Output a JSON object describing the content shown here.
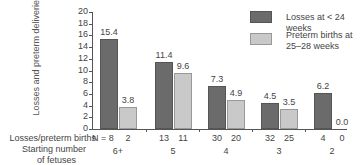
{
  "chart_data": {
    "type": "bar",
    "title": "",
    "ylabel": "Losses and preterm deliveries (percent)",
    "xlabel": "Starting number of fetuses",
    "ylim": [
      0,
      20
    ],
    "yticks": [
      "0",
      "2",
      "4",
      "6",
      "8",
      "10",
      "12",
      "14",
      "16",
      "18",
      "20"
    ],
    "categories": [
      "6+",
      "5",
      "4",
      "3",
      "2"
    ],
    "series": [
      {
        "name": "Losses at < 24 weeks",
        "color": "#6b6b6b",
        "values": [
          15.4,
          11.4,
          7.3,
          4.5,
          6.2
        ],
        "labels": [
          "15.4",
          "11.4",
          "7.3",
          "4.5",
          "6.2"
        ],
        "n": [
          "N = 8",
          "13",
          "30",
          "32",
          "4"
        ]
      },
      {
        "name": "Preterm births at 25–28 weeks",
        "color": "#c9c9c9",
        "values": [
          3.8,
          9.6,
          4.9,
          3.5,
          0.0
        ],
        "labels": [
          "3.8",
          "9.6",
          "4.9",
          "3.5",
          "0.0"
        ],
        "n": [
          "2",
          "11",
          "20",
          "25",
          "0"
        ]
      }
    ],
    "row_labels": {
      "n": "Losses/preterm births",
      "group_line1": "Starting number",
      "group_line2": "of fetuses"
    },
    "legend": {
      "position": "top-right",
      "items": [
        {
          "label": "Losses at < 24 weeks",
          "color": "#6b6b6b"
        },
        {
          "label_line1": "Preterm births at",
          "label_line2": "25–28 weeks",
          "color": "#c9c9c9"
        }
      ]
    },
    "grid": false
  }
}
